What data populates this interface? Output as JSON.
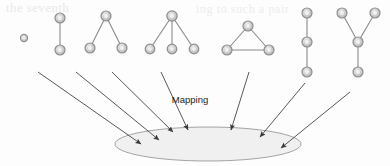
{
  "figure": {
    "label_mapping": "Mapping",
    "background_artifact_left": "the seventh",
    "background_artifact_right": "ing to such a pair",
    "colors": {
      "node_stroke": "#8e8e8e",
      "node_fill": "#d8d8d8",
      "node_inner": "#bdbdbd",
      "edge": "#8a8a8a",
      "arrow": "#3a3a3a",
      "ellipse_fill": "#f0f0f0",
      "ellipse_stroke": "#9a9a9a",
      "label_text": "#1c1c1c",
      "page_background": "#fdfdfd"
    },
    "graphs": [
      {
        "id": "graph-1",
        "name": "single-node",
        "node_count": 1,
        "edge_count": 0,
        "nodes": [
          [
            24,
            38
          ]
        ],
        "edges": [],
        "node_radius": 3.6
      },
      {
        "id": "graph-2",
        "name": "two-node-edge",
        "node_count": 2,
        "edge_count": 1,
        "nodes": [
          [
            60,
            18
          ],
          [
            60,
            50
          ]
        ],
        "edges": [
          [
            0,
            1
          ]
        ],
        "node_radius": 5.0
      },
      {
        "id": "graph-3",
        "name": "star-two-leaves",
        "node_count": 3,
        "edge_count": 2,
        "nodes": [
          [
            106,
            16
          ],
          [
            90,
            48
          ],
          [
            122,
            48
          ]
        ],
        "edges": [
          [
            0,
            1
          ],
          [
            0,
            2
          ]
        ],
        "node_radius": 5.0
      },
      {
        "id": "graph-4",
        "name": "star-three-leaves",
        "node_count": 4,
        "edge_count": 3,
        "nodes": [
          [
            172,
            16
          ],
          [
            150,
            49
          ],
          [
            172,
            49
          ],
          [
            194,
            49
          ]
        ],
        "edges": [
          [
            0,
            1
          ],
          [
            0,
            2
          ],
          [
            0,
            3
          ]
        ],
        "node_radius": 5.0
      },
      {
        "id": "graph-5",
        "name": "triangle-cycle",
        "node_count": 3,
        "edge_count": 3,
        "nodes": [
          [
            248,
            26
          ],
          [
            227,
            50
          ],
          [
            269,
            50
          ]
        ],
        "edges": [
          [
            0,
            1
          ],
          [
            1,
            2
          ],
          [
            2,
            0
          ]
        ],
        "node_radius": 5.0
      },
      {
        "id": "graph-6",
        "name": "three-node-path",
        "node_count": 3,
        "edge_count": 2,
        "nodes": [
          [
            307,
            13
          ],
          [
            307,
            42
          ],
          [
            307,
            72
          ]
        ],
        "edges": [
          [
            0,
            1
          ],
          [
            1,
            2
          ]
        ],
        "node_radius": 5.0
      },
      {
        "id": "graph-7",
        "name": "y-shape-tree",
        "node_count": 4,
        "edge_count": 3,
        "nodes": [
          [
            342,
            13
          ],
          [
            375,
            13
          ],
          [
            358,
            42
          ],
          [
            358,
            72
          ]
        ],
        "edges": [
          [
            0,
            2
          ],
          [
            1,
            2
          ],
          [
            2,
            3
          ]
        ],
        "node_radius": 5.0
      }
    ],
    "arrows": [
      {
        "id": "arrow-1",
        "from": [
          38,
          72
        ],
        "to": [
          141,
          144
        ]
      },
      {
        "id": "arrow-2",
        "from": [
          76,
          72
        ],
        "to": [
          159,
          140
        ]
      },
      {
        "id": "arrow-3",
        "from": [
          112,
          72
        ],
        "to": [
          173,
          132
        ]
      },
      {
        "id": "arrow-4",
        "from": [
          161,
          72
        ],
        "to": [
          188,
          130
        ]
      },
      {
        "id": "arrow-5",
        "from": [
          249,
          72
        ],
        "to": [
          231,
          130
        ]
      },
      {
        "id": "arrow-6",
        "from": [
          305,
          83
        ],
        "to": [
          260,
          137
        ]
      },
      {
        "id": "arrow-7",
        "from": [
          350,
          92
        ],
        "to": [
          281,
          148
        ]
      }
    ],
    "ellipse": {
      "id": "mapping-target-ellipse",
      "cx": 208,
      "cy": 144,
      "rx": 93,
      "ry": 17
    },
    "label_position": {
      "x": 190,
      "y": 103
    }
  }
}
